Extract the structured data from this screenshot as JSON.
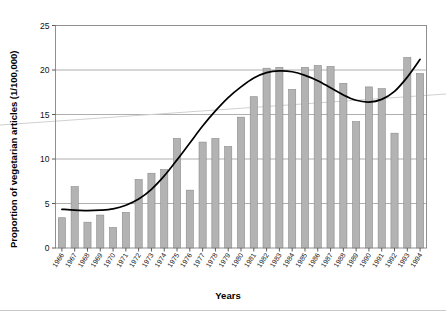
{
  "chart_data": {
    "type": "bar",
    "title": "",
    "xlabel": "Years",
    "ylabel": "Proportion of vegetarian articles (1/100,000)",
    "ylim": [
      0,
      25
    ],
    "yticks": [
      0,
      5,
      10,
      15,
      20,
      25
    ],
    "grid": true,
    "legend": "none",
    "categories": [
      "1966",
      "1967",
      "1968",
      "1969",
      "1970",
      "1971",
      "1972",
      "1973",
      "1974",
      "1975",
      "1976",
      "1977",
      "1978",
      "1979",
      "1980",
      "1981",
      "1982",
      "1983",
      "1984",
      "1985",
      "1986",
      "1987",
      "1988",
      "1989",
      "1990",
      "1991",
      "1992",
      "1993",
      "1994"
    ],
    "values": [
      3.4,
      6.9,
      2.9,
      3.7,
      2.3,
      4.0,
      7.7,
      8.4,
      8.8,
      12.3,
      6.5,
      11.9,
      12.3,
      11.4,
      14.7,
      17.0,
      20.2,
      20.3,
      17.8,
      20.3,
      20.5,
      20.4,
      18.5,
      14.2,
      18.1,
      17.9,
      12.9,
      21.4,
      19.6
    ],
    "series": [
      {
        "name": "Proportion of vegetarian articles",
        "type": "bar",
        "color": "#b3b3b3",
        "values": [
          3.4,
          6.9,
          2.9,
          3.7,
          2.3,
          4.0,
          7.7,
          8.4,
          8.8,
          12.3,
          6.5,
          11.9,
          12.3,
          11.4,
          14.7,
          17.0,
          20.2,
          20.3,
          17.8,
          20.3,
          20.5,
          20.4,
          18.5,
          14.2,
          18.1,
          17.9,
          12.9,
          21.4,
          19.6
        ]
      },
      {
        "name": "Fitted trend curve",
        "type": "line",
        "color": "#000000",
        "values": [
          4.35,
          4.25,
          4.2,
          4.25,
          4.4,
          4.8,
          5.5,
          6.6,
          8.1,
          9.9,
          11.8,
          13.7,
          15.4,
          16.9,
          18.1,
          19.1,
          19.7,
          19.9,
          19.8,
          19.4,
          18.8,
          18.0,
          17.2,
          16.6,
          16.4,
          16.7,
          17.6,
          19.2,
          21.2
        ]
      },
      {
        "name": "Linear trend line",
        "type": "line",
        "color": "#d0d0d0",
        "values": [
          14.3,
          14.4,
          14.5,
          14.6,
          14.7,
          14.8,
          14.9,
          15.0,
          15.1,
          15.2,
          15.3,
          15.4,
          15.5,
          15.6,
          15.7,
          15.8,
          15.9,
          16.0,
          16.1,
          16.2,
          16.3,
          16.4,
          16.5,
          16.6,
          16.7,
          16.8,
          16.9,
          17.0,
          17.1
        ]
      }
    ],
    "axis_frame": true,
    "bar_edge_color": "#8a8a8a"
  }
}
